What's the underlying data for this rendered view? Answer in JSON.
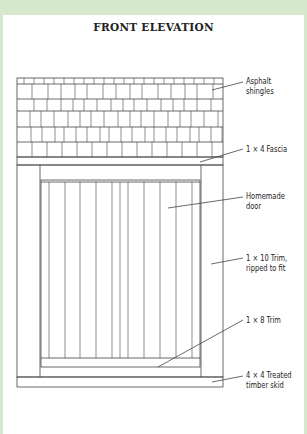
{
  "title": "FRONT ELEVATION",
  "labels": {
    "shingles": {
      "line1": "Asphalt",
      "line2": "shingles"
    },
    "fascia": {
      "line1": "1 × 4 Fascia"
    },
    "door": {
      "line1": "Homemade",
      "line2": "door"
    },
    "trim10": {
      "line1": "1 × 10 Trim,",
      "line2": "ripped to fit"
    },
    "trim8": {
      "line1": "1 × 8 Trim"
    },
    "skid": {
      "line1": "4 × 4 Treated",
      "line2": "timber skid"
    }
  },
  "colors": {
    "background": "#d5e8cb",
    "panel": "#ffffff",
    "line": "#333333"
  }
}
